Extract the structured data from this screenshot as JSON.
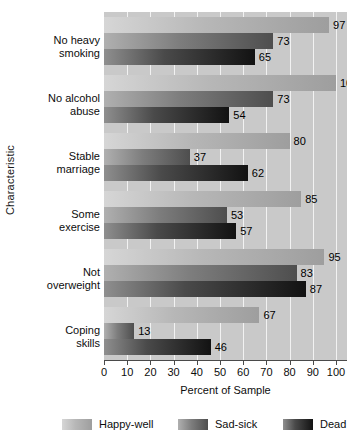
{
  "chart_data": {
    "type": "bar",
    "orientation": "horizontal",
    "title": "",
    "xlabel": "Percent of Sample",
    "ylabel": "Characteristic",
    "xlim": [
      0,
      105
    ],
    "xticks": [
      0,
      10,
      20,
      30,
      40,
      50,
      60,
      70,
      80,
      90,
      100
    ],
    "grid": true,
    "legend_position": "bottom",
    "categories": [
      "No heavy smoking",
      "No alcohol abuse",
      "Stable marriage",
      "Some exercise",
      "Not overweight",
      "Coping skills"
    ],
    "series": [
      {
        "name": "Happy-well",
        "color": "#b7b7b7",
        "values": [
          97,
          100,
          80,
          85,
          95,
          67
        ]
      },
      {
        "name": "Sad-sick",
        "color": "#7d7d7d",
        "values": [
          73,
          73,
          37,
          53,
          83,
          13
        ]
      },
      {
        "name": "Dead",
        "color": "#2b2b2b",
        "values": [
          65,
          54,
          62,
          57,
          87,
          46
        ]
      }
    ]
  },
  "axes": {
    "y_title": "Characteristic",
    "x_title": "Percent of Sample",
    "x_tick_labels": [
      "0",
      "10",
      "20",
      "30",
      "40",
      "50",
      "60",
      "70",
      "80",
      "90",
      "100"
    ],
    "category_labels": [
      {
        "line1": "No heavy",
        "line2": "smoking"
      },
      {
        "line1": "No alcohol",
        "line2": "abuse"
      },
      {
        "line1": "Stable",
        "line2": "marriage"
      },
      {
        "line1": "Some",
        "line2": "exercise"
      },
      {
        "line1": "Not",
        "line2": "overweight"
      },
      {
        "line1": "Coping",
        "line2": "skills"
      }
    ]
  },
  "values_text": {
    "g0": [
      "97",
      "73",
      "65"
    ],
    "g1": [
      "100",
      "73",
      "54"
    ],
    "g2": [
      "80",
      "37",
      "62"
    ],
    "g3": [
      "85",
      "53",
      "57"
    ],
    "g4": [
      "95",
      "83",
      "87"
    ],
    "g5": [
      "67",
      "13",
      "46"
    ]
  },
  "legend": {
    "items": [
      {
        "label": "Happy-well",
        "swatch": "happy-well-swatch"
      },
      {
        "label": "Sad-sick",
        "swatch": "sad-sick-swatch"
      },
      {
        "label": "Dead",
        "swatch": "dead-swatch"
      }
    ]
  },
  "colors": {
    "plot_background": "#c9c9c9",
    "gridline": "#f2f2f2",
    "axis": "#4a4a4a",
    "text": "#0d0d0d",
    "happy_well": "#b7b7b7",
    "sad_sick": "#7d7d7d",
    "dead": "#2b2b2b"
  }
}
